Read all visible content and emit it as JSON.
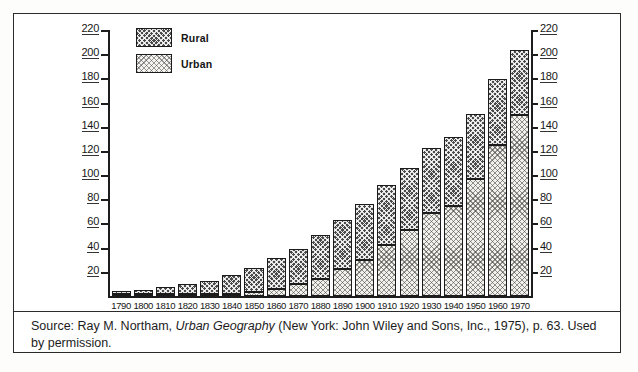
{
  "figure": {
    "legend": {
      "rural_label": "Rural",
      "urban_label": "Urban"
    },
    "caption": {
      "prefix": "Source: Ray M. Northam, ",
      "title_italic": "Urban Geography",
      "suffix": " (New York: John Wiley and Sons, Inc., 1975), p. 63. Used by permission."
    }
  },
  "chart_data": {
    "type": "bar",
    "stacked": true,
    "title": "",
    "xlabel": "",
    "ylabel": "",
    "ylim": [
      0,
      220
    ],
    "grid": false,
    "legend_position": "top-left",
    "y_ticks": [
      20,
      40,
      60,
      80,
      100,
      120,
      140,
      160,
      180,
      200,
      220
    ],
    "y_axis_left_ticks": [
      "20",
      "40",
      "60",
      "80",
      "100",
      "120",
      "140",
      "160",
      "180",
      "200",
      "220"
    ],
    "y_axis_right_ticks": [
      "20",
      "40",
      "60",
      "80",
      "100",
      "120",
      "140",
      "160",
      "180",
      "200",
      "220"
    ],
    "categories": [
      "1790",
      "1800",
      "1810",
      "1820",
      "1830",
      "1840",
      "1850",
      "1860",
      "1870",
      "1880",
      "1890",
      "1900",
      "1910",
      "1920",
      "1930",
      "1940",
      "1950",
      "1960",
      "1970"
    ],
    "series": [
      {
        "name": "Urban",
        "values": [
          0.2,
          0.3,
          0.5,
          0.7,
          1.1,
          1.8,
          3.5,
          6.2,
          9.9,
          14.1,
          22.1,
          30.2,
          42.0,
          54.2,
          69.0,
          74.4,
          96.5,
          125.3,
          149.3
        ]
      },
      {
        "name": "Rural",
        "values": [
          3.7,
          4.9,
          6.7,
          8.9,
          11.7,
          15.2,
          19.6,
          25.2,
          28.7,
          36.0,
          40.8,
          45.8,
          50.0,
          51.6,
          53.8,
          57.2,
          54.2,
          54.1,
          54.0
        ]
      }
    ],
    "totals": [
      3.9,
      5.2,
      7.2,
      9.6,
      12.8,
      17.0,
      23.1,
      31.4,
      38.6,
      50.1,
      62.9,
      76.0,
      92.0,
      105.8,
      122.8,
      131.6,
      150.7,
      179.4,
      203.3
    ]
  }
}
